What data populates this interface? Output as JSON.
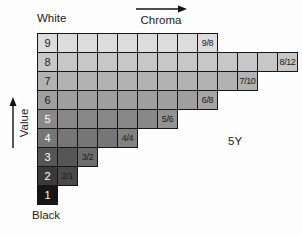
{
  "labels": {
    "white": "White",
    "black": "Black",
    "chroma_axis": "Chroma",
    "value_axis": "Value",
    "hue": "5Y"
  },
  "colors": {
    "background": "#fdfdfd",
    "grid_border": "#161616",
    "arrow": "#111111",
    "text": "#222222"
  },
  "chart_data": {
    "type": "heatmap",
    "x_axis_label": "Chroma",
    "y_axis_label": "Value",
    "hue_page": "5Y",
    "value_range": [
      1,
      9
    ],
    "chroma_step": 1,
    "top_anchor_label": "White",
    "bottom_anchor_label": "Black",
    "rows": [
      {
        "value": 9,
        "num_cells": 9,
        "max_chroma": 8,
        "chroma_label": "9/8",
        "color": "#dcdcdc",
        "label_cell_color": "#dcdcdc",
        "text_color": "#1a1a1a",
        "label_text_color": "#1a1a1a"
      },
      {
        "value": 8,
        "num_cells": 13,
        "max_chroma": 12,
        "chroma_label": "8/12",
        "color": "#c7c7c7",
        "label_cell_color": "#c7c7c7",
        "text_color": "#1a1a1a",
        "label_text_color": "#1a1a1a"
      },
      {
        "value": 7,
        "num_cells": 11,
        "max_chroma": 10,
        "chroma_label": "7/10",
        "color": "#b2b2b2",
        "label_cell_color": "#b2b2b2",
        "text_color": "#1a1a1a",
        "label_text_color": "#1a1a1a"
      },
      {
        "value": 6,
        "num_cells": 9,
        "max_chroma": 8,
        "chroma_label": "6/8",
        "color": "#9f9f9f",
        "label_cell_color": "#a5a5a5",
        "text_color": "#1a1a1a",
        "label_text_color": "#1a1a1a"
      },
      {
        "value": 5,
        "num_cells": 7,
        "max_chroma": 6,
        "chroma_label": "5/6",
        "color": "#888888",
        "label_cell_color": "#939393",
        "text_color": "#ffffff",
        "label_text_color": "#1a1a1a"
      },
      {
        "value": 4,
        "num_cells": 5,
        "max_chroma": 4,
        "chroma_label": "4/4",
        "color": "#767676",
        "label_cell_color": "#828282",
        "text_color": "#ffffff",
        "label_text_color": "#1a1a1a"
      },
      {
        "value": 3,
        "num_cells": 3,
        "max_chroma": 2,
        "chroma_label": "3/2",
        "color": "#565656",
        "label_cell_color": "#6d6d6d",
        "text_color": "#ffffff",
        "label_text_color": "#1a1a1a"
      },
      {
        "value": 2,
        "num_cells": 2,
        "max_chroma": 1,
        "chroma_label": "2/1",
        "color": "#3a3a3a",
        "label_cell_color": "#4a4a4a",
        "text_color": "#ffffff",
        "label_text_color": "#1a1a1a"
      },
      {
        "value": 1,
        "num_cells": 1,
        "max_chroma": 0,
        "chroma_label": null,
        "color": "#161616",
        "label_cell_color": null,
        "text_color": "#ffffff",
        "label_text_color": null
      }
    ]
  }
}
